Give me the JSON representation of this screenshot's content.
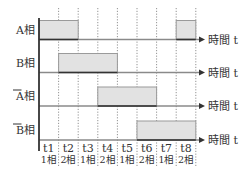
{
  "diagram": {
    "type": "stepper-motor-phase-timing",
    "axis_label": "時間 t",
    "phases": [
      {
        "label": "A相",
        "bar_label": "A",
        "overline": false,
        "pulses": [
          [
            0,
            2
          ],
          [
            7,
            8
          ]
        ]
      },
      {
        "label": "B相",
        "bar_label": "B",
        "overline": false,
        "pulses": [
          [
            1,
            4
          ]
        ]
      },
      {
        "label": "A相",
        "bar_label": "A",
        "overline": true,
        "pulses": [
          [
            3,
            6
          ]
        ]
      },
      {
        "label": "B相",
        "bar_label": "B",
        "overline": true,
        "pulses": [
          [
            5,
            8
          ]
        ]
      }
    ],
    "time_steps": [
      {
        "t": "t1",
        "mode": "1相"
      },
      {
        "t": "t2",
        "mode": "2相"
      },
      {
        "t": "t3",
        "mode": "1相"
      },
      {
        "t": "t4",
        "mode": "2相"
      },
      {
        "t": "t5",
        "mode": "1相"
      },
      {
        "t": "t6",
        "mode": "2相"
      },
      {
        "t": "t7",
        "mode": "1相"
      },
      {
        "t": "t8",
        "mode": "2相"
      }
    ],
    "colors": {
      "pulse_fill": "#e2e2e2",
      "pulse_stroke": "#9a9a9a",
      "baseline_active": "#333333",
      "baseline_idle": "#8a8a8a",
      "axis": "#333333",
      "grid": "#777777"
    }
  }
}
